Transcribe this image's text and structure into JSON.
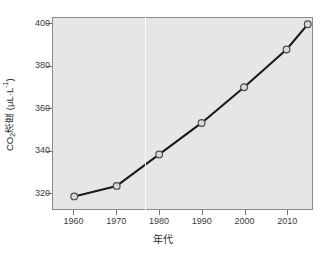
{
  "chart_data": {
    "type": "line",
    "title": "",
    "xlabel": "年代",
    "ylabel": "CO2浓度 (μL·L-1)",
    "ylabel_parts": {
      "prefix": "CO",
      "sub": "2",
      "middle": "浓度 (μL·L",
      "sup": "-1",
      "suffix": ")"
    },
    "x": [
      1960,
      1970,
      1980,
      1990,
      2000,
      2010,
      2015
    ],
    "values": [
      318,
      323,
      338,
      353,
      370,
      388,
      400
    ],
    "xticks": [
      "1960",
      "1970",
      "1980",
      "1990",
      "2000",
      "2010"
    ],
    "xtick_values": [
      1960,
      1970,
      1980,
      1990,
      2000,
      2010
    ],
    "yticks": [
      "320",
      "340",
      "360",
      "380",
      "400"
    ],
    "ytick_values": [
      320,
      340,
      360,
      380,
      400
    ],
    "xlim": [
      1955,
      2016
    ],
    "ylim": [
      312,
      403
    ],
    "grid": false,
    "legend": null,
    "marker": "open-circle",
    "line_color": "#1a1a1a",
    "marker_face_color": "#d9d9d9",
    "marker_edge_color": "#4d4d4d",
    "plot_background": "#e6e6e6",
    "figure_background": "#ffffff",
    "axis_color": "#8a8a8a"
  }
}
